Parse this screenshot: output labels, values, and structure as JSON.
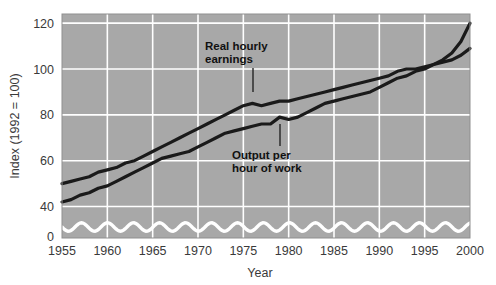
{
  "chart_data": {
    "type": "line",
    "title": "",
    "xlabel": "Year",
    "ylabel": "Index (1992 = 100)",
    "xlim": [
      1955,
      2000
    ],
    "ylim": [
      35,
      124
    ],
    "grid": true,
    "legend": "none (inline annotations)",
    "axis_break": true,
    "background_color": "#a8a8a8",
    "gridline_color": "#ffffff",
    "line_color": "#1a1a1a",
    "y_ticks": [
      "0",
      "40",
      "60",
      "80",
      "100",
      "120"
    ],
    "y_tick_values": [
      0,
      40,
      60,
      80,
      100,
      120
    ],
    "x_ticks": [
      "1955",
      "1960",
      "1965",
      "1970",
      "1975",
      "1980",
      "1985",
      "1990",
      "1995",
      "2000"
    ],
    "x_tick_values": [
      1955,
      1960,
      1965,
      1970,
      1975,
      1980,
      1985,
      1990,
      1995,
      2000
    ],
    "x": [
      1955,
      1956,
      1957,
      1958,
      1959,
      1960,
      1961,
      1962,
      1963,
      1964,
      1965,
      1966,
      1967,
      1968,
      1969,
      1970,
      1971,
      1972,
      1973,
      1974,
      1975,
      1976,
      1977,
      1978,
      1979,
      1980,
      1981,
      1982,
      1983,
      1984,
      1985,
      1986,
      1987,
      1988,
      1989,
      1990,
      1991,
      1992,
      1993,
      1994,
      1995,
      1996,
      1997,
      1998,
      1999,
      2000
    ],
    "series": [
      {
        "name": "Real hourly earnings",
        "values": [
          50,
          51,
          52,
          53,
          55,
          56,
          57,
          59,
          60,
          62,
          64,
          66,
          68,
          70,
          72,
          74,
          76,
          78,
          80,
          82,
          84,
          85,
          84,
          85,
          86,
          86,
          87,
          88,
          89,
          90,
          91,
          92,
          93,
          94,
          95,
          96,
          97,
          99,
          100,
          100,
          101,
          102,
          103,
          104,
          106,
          109
        ]
      },
      {
        "name": "Output per hour of work",
        "values": [
          42,
          43,
          45,
          46,
          48,
          49,
          51,
          53,
          55,
          57,
          59,
          61,
          62,
          63,
          64,
          66,
          68,
          70,
          72,
          73,
          74,
          75,
          76,
          76,
          79,
          78,
          79,
          81,
          83,
          85,
          86,
          87,
          88,
          89,
          90,
          92,
          94,
          96,
          97,
          99,
          100,
          102,
          104,
          107,
          112,
          120
        ]
      }
    ],
    "annotations": [
      {
        "label_line1": "Real hourly",
        "label_line2": "earnings",
        "points_to_year": 1973,
        "leader": "down"
      },
      {
        "label_line1": "Output per",
        "label_line2": "hour of work",
        "points_to_year": 1978,
        "leader": "up"
      }
    ]
  }
}
